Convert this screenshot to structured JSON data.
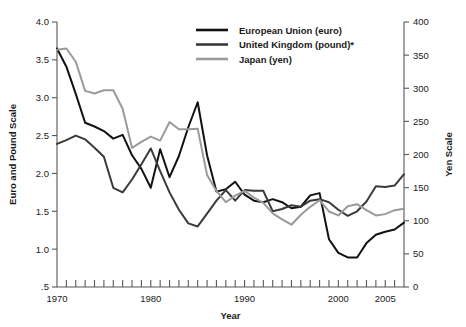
{
  "chart_data": {
    "type": "line",
    "title": "",
    "xlabel": "Year",
    "ylabel": "Euro and Pound Scale",
    "y2label": "Yen Scale",
    "grid": false,
    "legend_position": "top-center",
    "xlim": [
      1970,
      2007
    ],
    "ylim": [
      0.5,
      4.0
    ],
    "y2lim": [
      0,
      400
    ],
    "x_ticks_major": [
      1970,
      1980,
      1990,
      2000,
      2005
    ],
    "x_tick_labels": [
      "1970",
      "1980",
      "1990",
      "2000",
      "2005"
    ],
    "x_ticks_minor_every": 1,
    "y_ticks": [
      0.5,
      1.0,
      1.5,
      2.0,
      2.5,
      3.0,
      3.5,
      4.0
    ],
    "y_tick_labels": [
      ".5",
      "1.0",
      "1.5",
      "2.0",
      "2.5",
      "3.0",
      "3.5",
      "4.0"
    ],
    "y2_ticks": [
      0,
      50,
      100,
      150,
      200,
      250,
      300,
      350,
      400
    ],
    "y2_tick_labels": [
      "0",
      "50",
      "100",
      "150",
      "200",
      "250",
      "300",
      "350",
      "400"
    ],
    "x": [
      1970,
      1971,
      1972,
      1973,
      1974,
      1975,
      1976,
      1977,
      1978,
      1979,
      1980,
      1981,
      1982,
      1983,
      1984,
      1985,
      1986,
      1987,
      1988,
      1989,
      1990,
      1991,
      1992,
      1993,
      1994,
      1995,
      1996,
      1997,
      1998,
      1999,
      2000,
      2001,
      2002,
      2003,
      2004,
      2005,
      2006,
      2007
    ],
    "series": [
      {
        "name": "European Union (euro)",
        "axis": "left",
        "color": "#111111",
        "values": [
          3.65,
          3.41,
          3.05,
          2.67,
          2.62,
          2.56,
          2.46,
          2.51,
          2.24,
          2.06,
          1.81,
          2.32,
          1.95,
          2.23,
          2.61,
          2.94,
          2.24,
          1.76,
          1.79,
          1.89,
          1.72,
          1.64,
          1.62,
          1.66,
          1.62,
          1.54,
          1.56,
          1.71,
          1.74,
          1.13,
          0.95,
          0.89,
          0.89,
          1.08,
          1.19,
          1.23,
          1.26,
          1.35
        ]
      },
      {
        "name": "United Kingdom (pound)*",
        "axis": "left",
        "color": "#3a3a3a",
        "values": [
          2.39,
          2.44,
          2.5,
          2.45,
          2.34,
          2.22,
          1.81,
          1.75,
          1.92,
          2.12,
          2.33,
          2.03,
          1.75,
          1.52,
          1.34,
          1.3,
          1.47,
          1.64,
          1.78,
          1.64,
          1.78,
          1.77,
          1.77,
          1.5,
          1.53,
          1.58,
          1.56,
          1.64,
          1.66,
          1.62,
          1.52,
          1.44,
          1.5,
          1.63,
          1.83,
          1.82,
          1.84,
          1.99
        ]
      },
      {
        "name": "Japan (yen)",
        "axis": "right",
        "color": "#9a9a9a",
        "values": [
          358,
          360,
          340,
          296,
          292,
          297,
          297,
          269,
          210,
          219,
          227,
          221,
          249,
          238,
          238,
          239,
          169,
          145,
          128,
          138,
          145,
          135,
          127,
          111,
          102,
          94,
          109,
          121,
          131,
          114,
          108,
          122,
          125,
          116,
          108,
          110,
          116,
          118
        ]
      }
    ]
  },
  "legend": {
    "entries": [
      {
        "label": "European Union (euro)",
        "color": "#111111"
      },
      {
        "label": "United Kingdom (pound)*",
        "color": "#3a3a3a"
      },
      {
        "label": "Japan (yen)",
        "color": "#9a9a9a"
      }
    ]
  },
  "axes": {
    "left_title": "Euro and Pound Scale",
    "right_title": "Yen Scale",
    "x_title": "Year"
  }
}
